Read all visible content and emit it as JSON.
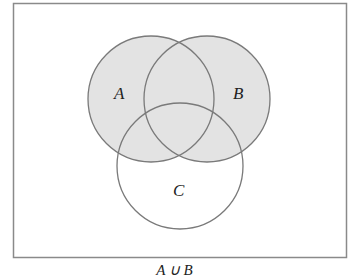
{
  "diagram": {
    "type": "venn",
    "sets": [
      {
        "id": "A",
        "label": "A",
        "cx": 151,
        "cy": 99,
        "r": 63,
        "shaded": true
      },
      {
        "id": "B",
        "label": "B",
        "cx": 207,
        "cy": 99,
        "r": 63,
        "shaded": true
      },
      {
        "id": "C",
        "label": "C",
        "cx": 180,
        "cy": 166,
        "r": 63,
        "shaded": false
      }
    ],
    "shaded_region": "A ∪ B",
    "colors": {
      "shade": "#e3e3e3",
      "stroke": "#7a7a7a",
      "border": "#8a8a8a",
      "background": "#ffffff"
    }
  },
  "caption": "A ∪ B"
}
